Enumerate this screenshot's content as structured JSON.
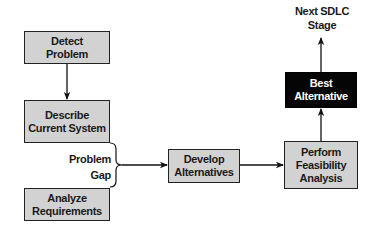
{
  "diagram": {
    "nodes": {
      "detect_problem": {
        "line1": "Detect",
        "line2": "Problem"
      },
      "describe_current_system": {
        "line1": "Describe",
        "line2": "Current System"
      },
      "analyze_requirements": {
        "line1": "Analyze",
        "line2": "Requirements"
      },
      "develop_alternatives": {
        "line1": "Develop",
        "line2": "Alternatives"
      },
      "perform_feasibility_analysis": {
        "line1": "Perform",
        "line2": "Feasibility",
        "line3": "Analysis"
      },
      "best_alternative": {
        "line1": "Best",
        "line2": "Alternative"
      }
    },
    "labels": {
      "problem_gap": {
        "line1": "Problem",
        "line2": "Gap"
      },
      "next_stage": {
        "line1": "Next SDLC",
        "line2": "Stage"
      }
    },
    "edges": [
      {
        "from": "detect_problem",
        "to": "describe_current_system"
      },
      {
        "from": "problem_gap",
        "to": "develop_alternatives"
      },
      {
        "from": "develop_alternatives",
        "to": "perform_feasibility_analysis"
      },
      {
        "from": "perform_feasibility_analysis",
        "to": "best_alternative"
      },
      {
        "from": "best_alternative",
        "to": "next_stage"
      }
    ],
    "colors": {
      "box_fill": "#d2d2d2",
      "highlight_fill": "#050505",
      "line": "#222222"
    }
  }
}
